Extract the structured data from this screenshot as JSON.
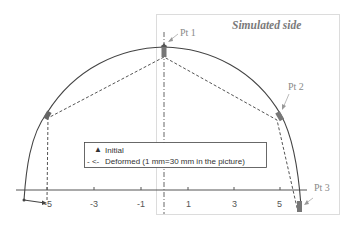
{
  "diagram": {
    "title": "Simulated side",
    "points": [
      {
        "label": "Pt 1"
      },
      {
        "label": "Pt 2"
      },
      {
        "label": "Pt 3"
      }
    ],
    "axis": {
      "ticks": [
        "-5",
        "-3",
        "-1",
        "1",
        "3",
        "5"
      ]
    },
    "legend": {
      "initial_marker": "▲",
      "initial_label": "Initial",
      "deformed_marker": "- <-",
      "deformed_label": "Deformed (1 mm=30 mm in the picture)"
    },
    "colors": {
      "initial_curve": "#444444",
      "deformed_curve": "#555555",
      "box_border": "#b0b0b0",
      "label_gray": "#8a8a8a"
    }
  }
}
